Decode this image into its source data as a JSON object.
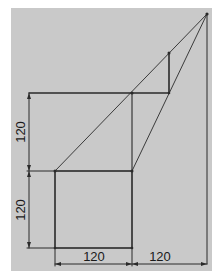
{
  "diagram": {
    "type": "geometric-construction",
    "background_color": "#c9c9c9",
    "line_color": "#2a2a2a",
    "dimensions": {
      "left_upper": "120",
      "left_lower": "120",
      "bottom_left": "120",
      "bottom_right": "120"
    },
    "shapes": {
      "square": {
        "side": 120
      },
      "step_square_label": "middle square corner"
    }
  }
}
